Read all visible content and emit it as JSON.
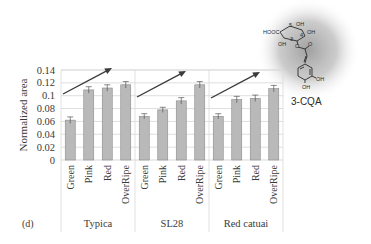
{
  "panel_label": "(d)",
  "molecule": {
    "name": "3-CQA",
    "labels": [
      "HOOC",
      "5",
      "OH",
      "4",
      "OH",
      "3",
      "OH",
      "O",
      "O",
      "OH",
      "OH"
    ]
  },
  "colors": {
    "bar_fill": "#b9b9b9",
    "bar_stroke": "#8a8a8a",
    "grid": "#d6d6d6",
    "frame": "#d9d9d9",
    "arrow": "#3b3b3b",
    "text": "#3a3a3a",
    "halo": "#9a9a9a"
  },
  "chart_data": {
    "type": "bar",
    "title": "",
    "xlabel": "",
    "ylabel": "Normalized area",
    "ylim": [
      0,
      0.14
    ],
    "yticks": [
      0,
      0.02,
      0.04,
      0.06,
      0.08,
      0.1,
      0.12,
      0.14
    ],
    "ytick_labels": [
      "0",
      "0.02",
      "0.04",
      "0.06",
      "0.08",
      "0.1",
      "0.12",
      "0.14"
    ],
    "grid": true,
    "legend": null,
    "groups": [
      "Typica",
      "SL28",
      "Red catuai"
    ],
    "categories": [
      "Green",
      "Pink",
      "Red",
      "OverRipe"
    ],
    "series": [
      {
        "name": "Typica",
        "values": [
          0.062,
          0.109,
          0.112,
          0.117
        ],
        "errors": [
          0.005,
          0.005,
          0.005,
          0.005
        ]
      },
      {
        "name": "SL28",
        "values": [
          0.068,
          0.078,
          0.092,
          0.117
        ],
        "errors": [
          0.004,
          0.004,
          0.005,
          0.005
        ]
      },
      {
        "name": "Red catuai",
        "values": [
          0.068,
          0.094,
          0.096,
          0.111
        ],
        "errors": [
          0.004,
          0.005,
          0.005,
          0.005
        ]
      }
    ],
    "annotations": [
      "increasing trend arrow per cultivar",
      "3-CQA structure inset"
    ]
  }
}
